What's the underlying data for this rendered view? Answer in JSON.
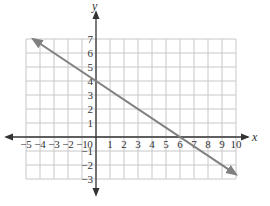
{
  "chart_data": {
    "type": "line",
    "title": "",
    "xlabel": "x",
    "ylabel": "y",
    "xlim": [
      -5,
      10
    ],
    "ylim": [
      -3,
      7
    ],
    "grid": true,
    "x_ticks": [
      -5,
      -4,
      -3,
      -2,
      -1,
      0,
      1,
      2,
      3,
      4,
      5,
      6,
      7,
      8,
      9,
      10
    ],
    "y_ticks": [
      -3,
      -2,
      -1,
      1,
      2,
      3,
      4,
      5,
      6,
      7
    ],
    "series": [
      {
        "name": "y = -2/3 x + 4",
        "slope": -0.6667,
        "intercept": 4,
        "points": [
          [
            -4.5,
            7
          ],
          [
            0,
            4
          ],
          [
            6,
            0
          ],
          [
            10,
            -2.667
          ]
        ],
        "arrows": "both",
        "color": "#808080"
      }
    ]
  },
  "colors": {
    "grid": "#c8c8c8",
    "axis": "#333333",
    "line": "#808080"
  }
}
